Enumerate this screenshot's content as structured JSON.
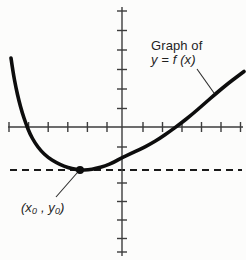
{
  "figure": {
    "width": 246,
    "height": 260
  },
  "colors": {
    "background": "#fcfcfb",
    "axis": "#3d3d3d",
    "curve": "#0d0d0d",
    "dashed_line": "#1a1a1a",
    "leader_line": "#2b2b2b",
    "text": "#1f1f1f"
  },
  "annotations": {
    "curve_label": {
      "line1": "Graph of",
      "line2": "y = f (x)"
    },
    "point_label": {
      "text": "(x₀ , y₀)"
    }
  },
  "chart_data": {
    "type": "line",
    "xlabel": "",
    "ylabel": "",
    "grid": false,
    "legend": "none",
    "axis_numeric_labels": "none",
    "axes": {
      "x_axis": {
        "y_px": 127,
        "from_px": 8,
        "to_px": 243,
        "ticks_px": [
          9,
          28.6,
          48.2,
          67.8,
          87.4,
          107,
          143,
          162.5,
          182,
          201.5,
          221,
          240.5
        ]
      },
      "y_axis": {
        "x_px": 122,
        "from_px": 7,
        "to_px": 256,
        "ticks_px": [
          11,
          30.5,
          50,
          69.5,
          89,
          108.5,
          147,
          183,
          201.5,
          220,
          238.5,
          252
        ]
      },
      "tick_half_length_px": 5,
      "tick_unit_px": 19.5
    },
    "series": [
      {
        "name": "y = f(x)",
        "points_px": [
          [
            11,
            58
          ],
          [
            13,
            72
          ],
          [
            16,
            88
          ],
          [
            19,
            101
          ],
          [
            22,
            112
          ],
          [
            26,
            124
          ],
          [
            30,
            134
          ],
          [
            35,
            143
          ],
          [
            41,
            151
          ],
          [
            48,
            157.5
          ],
          [
            56,
            162.5
          ],
          [
            64,
            166.2
          ],
          [
            72,
            168.8
          ],
          [
            80,
            170
          ],
          [
            88,
            169.9
          ],
          [
            96,
            168.6
          ],
          [
            105,
            166
          ],
          [
            114,
            162.3
          ],
          [
            122,
            157.5
          ],
          [
            131,
            153.6
          ],
          [
            140,
            149.3
          ],
          [
            150,
            144.3
          ],
          [
            160,
            138.3
          ],
          [
            170,
            131.3
          ],
          [
            180,
            124
          ],
          [
            192,
            114.5
          ],
          [
            204,
            104
          ],
          [
            216,
            93.5
          ],
          [
            228,
            83.5
          ],
          [
            238,
            76
          ],
          [
            244,
            71.5
          ]
        ]
      }
    ],
    "key_point": {
      "label": "(x0, y0)",
      "meaning": "minimum of f, tangency point of dashed horizontal line",
      "px": [
        80,
        170
      ],
      "radius_px": 4
    },
    "tangent_dashed_line": {
      "y_px": 170,
      "from_px": 10,
      "to_px": 242,
      "dash_pattern_px": [
        7,
        5
      ]
    },
    "leaders": [
      {
        "name": "curve-label-leader",
        "from_px": [
          197,
          69
        ],
        "to_px": [
          214,
          93
        ]
      },
      {
        "name": "point-label-leader",
        "from_px": [
          56,
          197
        ],
        "to_px": [
          77,
          173
        ]
      }
    ]
  }
}
